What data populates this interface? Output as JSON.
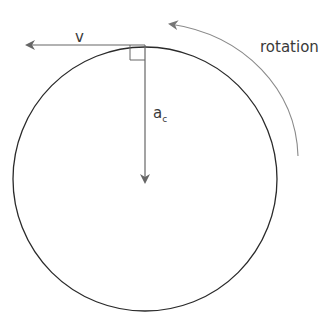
{
  "diagram": {
    "labels": {
      "velocity": "v",
      "centripetal_accel": "a",
      "centripetal_accel_sub": "c",
      "rotation": "rotation"
    },
    "colors": {
      "circle": "#2a2a2a",
      "arrows": "#666666",
      "rotation_arrow": "#8a8a8a",
      "text": "#3a3a3a"
    }
  }
}
